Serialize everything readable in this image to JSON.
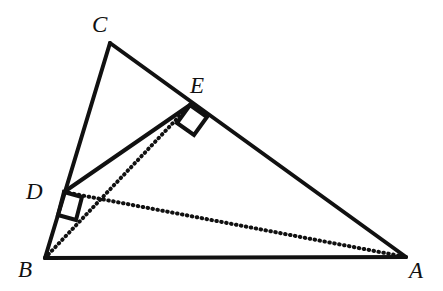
{
  "figure": {
    "kind": "euclidean-geometry-diagram",
    "canvas": {
      "width": 443,
      "height": 291,
      "background": "#ffffff"
    },
    "stroke_color": "#111111",
    "solid_stroke_width": 4,
    "dotted_stroke_width": 4,
    "dot_pattern": "0.6 4.4",
    "points": [
      {
        "id": "A",
        "label": "A",
        "x": 406,
        "y": 257,
        "label_x": 409,
        "label_y": 259
      },
      {
        "id": "B",
        "label": "B",
        "x": 45,
        "y": 258,
        "label_x": 18,
        "label_y": 258
      },
      {
        "id": "C",
        "label": "C",
        "x": 110,
        "y": 43,
        "label_x": 92,
        "label_y": 13
      },
      {
        "id": "D",
        "label": "D",
        "x": 64,
        "y": 192,
        "label_x": 26,
        "label_y": 180
      },
      {
        "id": "E",
        "label": "E",
        "x": 190,
        "y": 105,
        "label_x": 190,
        "label_y": 74
      }
    ],
    "solid_segments": [
      {
        "id": "BC",
        "from": "B",
        "to": "C",
        "x1": 45,
        "y1": 258,
        "x2": 110,
        "y2": 43
      },
      {
        "id": "CA",
        "from": "C",
        "to": "A",
        "x1": 110,
        "y1": 43,
        "x2": 406,
        "y2": 257
      },
      {
        "id": "BA",
        "from": "B",
        "to": "A",
        "x1": 45,
        "y1": 258,
        "x2": 406,
        "y2": 257
      },
      {
        "id": "DE",
        "from": "D",
        "to": "E",
        "x1": 64,
        "y1": 192,
        "x2": 190,
        "y2": 105
      }
    ],
    "dotted_segments": [
      {
        "id": "BE",
        "from": "B",
        "to": "E",
        "x1": 45,
        "y1": 258,
        "x2": 190,
        "y2": 105
      },
      {
        "id": "DA",
        "from": "D",
        "to": "A",
        "x1": 64,
        "y1": 192,
        "x2": 406,
        "y2": 257
      }
    ],
    "right_angle_marks": [
      {
        "id": "right-angle-at-D",
        "at": "D",
        "between": [
          "DB",
          "DA"
        ],
        "points": "64,192 82,197 76,220 58,215"
      },
      {
        "id": "right-angle-at-E",
        "at": "E",
        "between": [
          "EB",
          "EA"
        ],
        "points": "190,105 207,117 194,135 177,123"
      }
    ]
  }
}
